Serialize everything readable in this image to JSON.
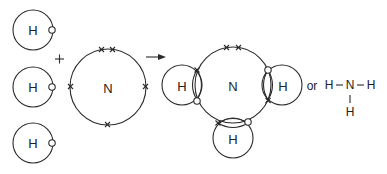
{
  "diagram": {
    "reactants": {
      "hydrogen_atoms": [
        {
          "label": "H",
          "electron": "o"
        },
        {
          "label": "H",
          "electron": "o"
        },
        {
          "label": "H",
          "electron": "o"
        }
      ],
      "plus_sign": "+",
      "nitrogen_atom": {
        "label": "N",
        "outer_electrons": 5,
        "electron": "x"
      }
    },
    "arrow": "→",
    "product": {
      "central_atom": "N",
      "bonded_atoms": [
        "H",
        "H",
        "H"
      ],
      "lone_pair": "x x"
    },
    "or_label": "or",
    "structural_formula": {
      "left_h": "H",
      "dash_left": "–",
      "center": "N",
      "dash_right": "–",
      "right_h": "H",
      "bottom_bar": "|",
      "bottom_h": "H"
    },
    "colors": {
      "stroke": "#2a2a2a",
      "background": "#ffffff",
      "text": "#222222"
    }
  }
}
